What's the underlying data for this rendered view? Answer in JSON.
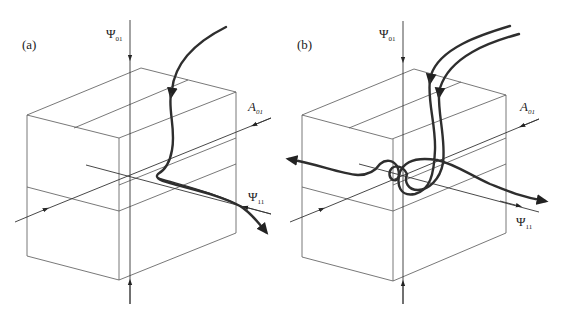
{
  "figure": {
    "panels": [
      {
        "id": "a",
        "label": "(a)",
        "labels": {
          "psi01": {
            "main": "Ψ",
            "sub": "01"
          },
          "a01": {
            "main": "A",
            "sub": "01"
          },
          "psi11": {
            "main": "Ψ",
            "sub": "11"
          }
        }
      },
      {
        "id": "b",
        "label": "(b)",
        "labels": {
          "psi01": {
            "main": "Ψ",
            "sub": "01"
          },
          "a01": {
            "main": "A",
            "sub": "01"
          },
          "psi11": {
            "main": "Ψ",
            "sub": "11"
          }
        }
      }
    ],
    "colors": {
      "box": "#555555",
      "axis": "#333333",
      "trajectory": "#2e2e2e",
      "background": "#ffffff"
    }
  }
}
